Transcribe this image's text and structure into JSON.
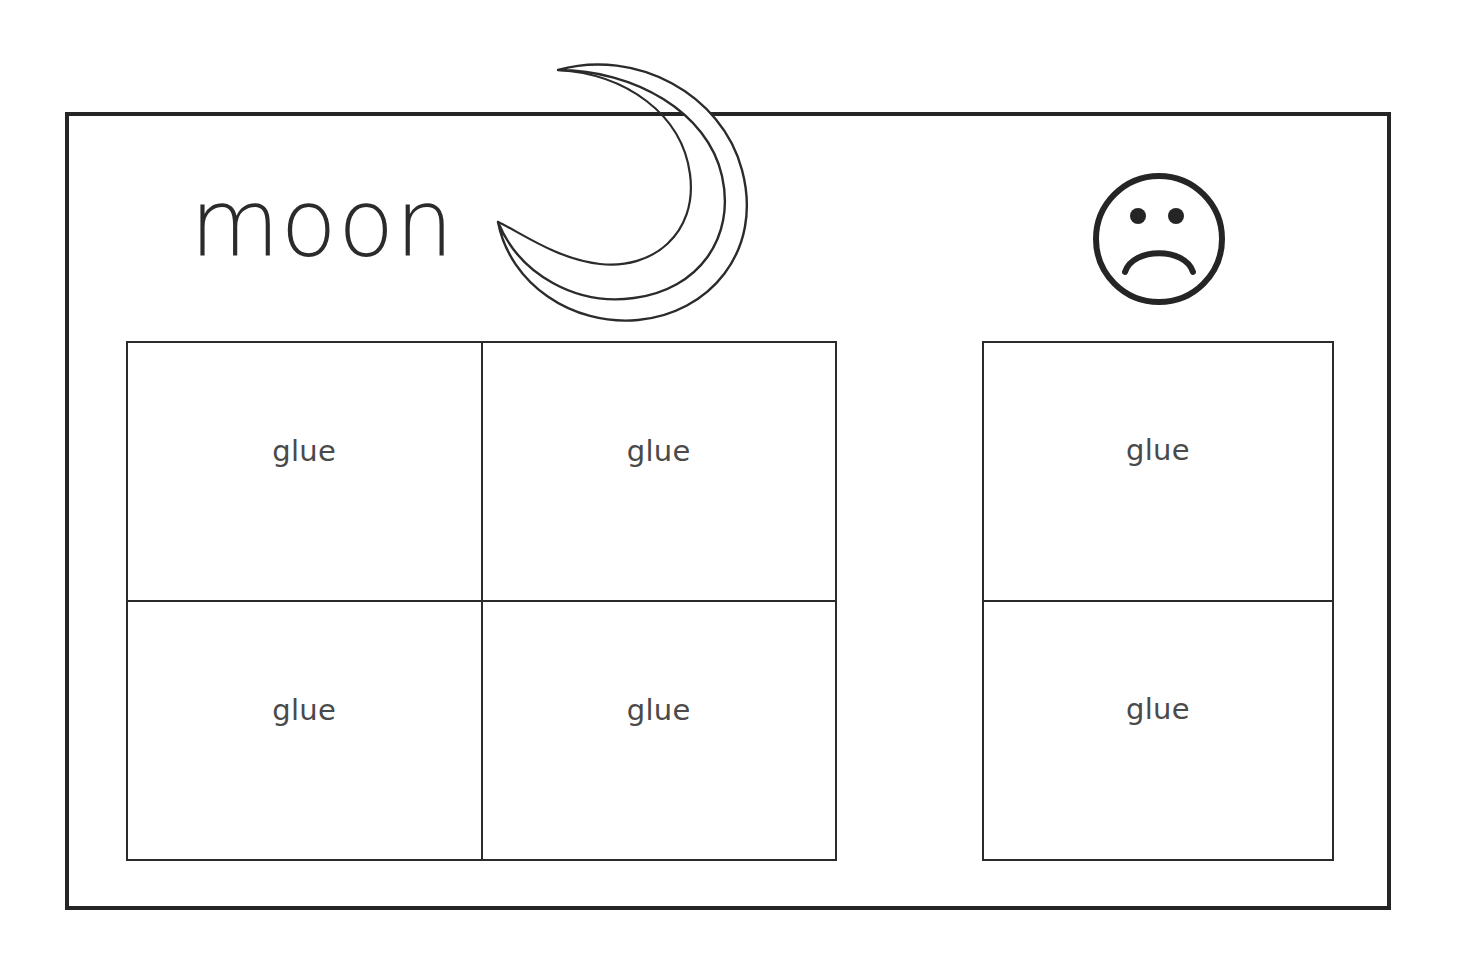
{
  "worksheet": {
    "prompt_word": "moon",
    "moon_icon": "crescent-moon-icon",
    "face_icon": "sad-face-icon",
    "left_grid": {
      "columns": 2,
      "rows": 2,
      "cells": [
        {
          "label": "glue"
        },
        {
          "label": "glue"
        },
        {
          "label": "glue"
        },
        {
          "label": "glue"
        }
      ]
    },
    "right_grid": {
      "columns": 1,
      "rows": 2,
      "cells": [
        {
          "label": "glue"
        },
        {
          "label": "glue"
        }
      ]
    },
    "colors": {
      "background": "#ffffff",
      "frame_stroke": "#252525",
      "grid_stroke": "#2b2b2b",
      "word_text": "#2b2b2b",
      "glue_text": "#4a4a4a",
      "illustration_stroke": "#2b2b2b"
    }
  }
}
